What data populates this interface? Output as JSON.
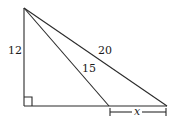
{
  "diagram": {
    "type": "right-triangle-geometry",
    "stroke_color": "#2a2a2a",
    "text_color": "#1a1a1a",
    "labels": {
      "vertical_leg": "12",
      "inner_hypotenuse": "15",
      "outer_hypotenuse": "20",
      "base_segment": "x"
    },
    "points": {
      "apex": [
        24,
        8
      ],
      "right_angle": [
        24,
        106
      ],
      "inner_base": [
        109,
        106
      ],
      "outer_base": [
        167,
        106
      ]
    },
    "right_angle_marker": true
  }
}
